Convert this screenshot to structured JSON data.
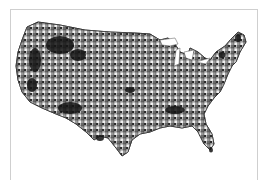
{
  "figure": {
    "type": "choropleth-map",
    "region": "Contiguous United States",
    "granularity": "county",
    "palette": [
      "#ffffff",
      "#d8d8d8",
      "#9a9a9a",
      "#5a5a5a",
      "#1a1a1a"
    ],
    "frame_color": "#cfcfcf",
    "background": "#ffffff"
  }
}
